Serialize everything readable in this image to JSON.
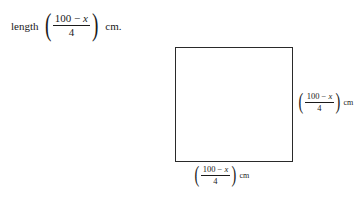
{
  "page": {
    "background_color": "#ffffff",
    "ink_color": "#1a1a1a",
    "stroke_color": "#2a2a2a"
  },
  "text_line": {
    "lead": "length",
    "expression": {
      "open_paren": "(",
      "numerator": "100 − ",
      "numerator_variable": "x",
      "fraction_denominator": "4",
      "close_paren": ")"
    },
    "unit": "cm."
  },
  "figure": {
    "shape": "square",
    "left": 175,
    "top": 47,
    "width": 118,
    "height": 115,
    "border_width_px": 1.7
  },
  "label_right": {
    "open_paren": "(",
    "numerator": "100 − ",
    "numerator_variable": "x",
    "fraction_denominator": "4",
    "close_paren": ")",
    "unit": "cm"
  },
  "label_bottom": {
    "open_paren": "(",
    "numerator": "100 − ",
    "numerator_variable": "x",
    "fraction_denominator": "4",
    "close_paren": ")",
    "unit": "cm"
  }
}
